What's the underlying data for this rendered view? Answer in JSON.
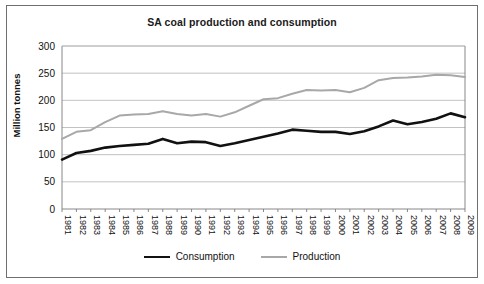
{
  "figure": {
    "title": "SA coal production and consumption",
    "background": "#ffffff",
    "border_color": "#6f6f6f"
  },
  "axes": {
    "ylabel": "Million tonnes",
    "yticks": [
      "0",
      "50",
      "100",
      "150",
      "200",
      "250",
      "300"
    ],
    "xticks": [
      "1981",
      "1982",
      "1983",
      "1984",
      "1985",
      "1986",
      "1987",
      "1988",
      "1989",
      "1990",
      "1991",
      "1992",
      "1993",
      "1994",
      "1995",
      "1996",
      "1997",
      "1998",
      "1999",
      "2000",
      "2001",
      "2002",
      "2003",
      "2004",
      "2005",
      "2006",
      "2007",
      "2008",
      "2009"
    ]
  },
  "legend": {
    "position": "bottom-center",
    "entries": [
      {
        "label": "Consumption",
        "color": "#111111",
        "linewidth": 2.6
      },
      {
        "label": "Production",
        "color": "#a8a8a8",
        "linewidth": 2.0
      }
    ]
  },
  "chart_data": {
    "type": "line",
    "title": "SA coal production and consumption",
    "xlabel": "",
    "ylabel": "Million tonnes",
    "ylim": [
      0,
      300
    ],
    "ytick_step": 50,
    "grid": "horizontal",
    "legend_position": "bottom-center",
    "x": [
      "1981",
      "1982",
      "1983",
      "1984",
      "1985",
      "1986",
      "1987",
      "1988",
      "1989",
      "1990",
      "1991",
      "1992",
      "1993",
      "1994",
      "1995",
      "1996",
      "1997",
      "1998",
      "1999",
      "2000",
      "2001",
      "2002",
      "2003",
      "2004",
      "2005",
      "2006",
      "2007",
      "2008",
      "2009"
    ],
    "series": [
      {
        "name": "Consumption",
        "color": "#111111",
        "values": [
          91,
          103,
          107,
          113,
          116,
          118,
          120,
          129,
          121,
          124,
          123,
          116,
          121,
          127,
          133,
          139,
          146,
          144,
          142,
          142,
          138,
          143,
          152,
          163,
          156,
          160,
          166,
          176,
          169
        ]
      },
      {
        "name": "Production",
        "color": "#a8a8a8",
        "values": [
          129,
          142,
          145,
          160,
          172,
          174,
          175,
          180,
          175,
          172,
          175,
          170,
          178,
          190,
          202,
          204,
          212,
          219,
          218,
          219,
          215,
          223,
          237,
          241,
          242,
          244,
          247,
          246,
          243
        ]
      }
    ]
  }
}
